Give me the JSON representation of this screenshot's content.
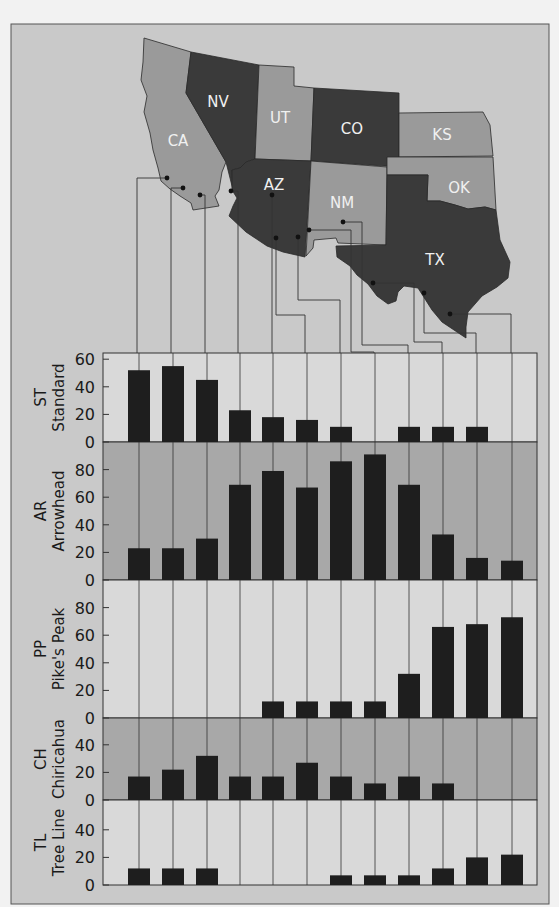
{
  "figure": {
    "frame": {
      "x": 11,
      "y": 24,
      "w": 538,
      "h": 880
    },
    "colors": {
      "page_bg": "#f2f2f2",
      "frame_bg": "#c9c9c9",
      "panel_light": "#d9d9d9",
      "panel_dark": "#a8a8a8",
      "bar": "#1e1e1e",
      "state_light": "#9a9a9a",
      "state_dark": "#3a3a3a",
      "state_label": "#f0f0f0",
      "line": "#333333",
      "text": "#1a1a1a"
    }
  },
  "map": {
    "states": [
      {
        "id": "CA",
        "label": "CA",
        "tone": "light",
        "label_x": 178,
        "label_y": 146
      },
      {
        "id": "NV",
        "label": "NV",
        "tone": "dark",
        "label_x": 218,
        "label_y": 107
      },
      {
        "id": "UT",
        "label": "UT",
        "tone": "light",
        "label_x": 280,
        "label_y": 123
      },
      {
        "id": "CO",
        "label": "CO",
        "tone": "dark",
        "label_x": 352,
        "label_y": 134
      },
      {
        "id": "KS",
        "label": "KS",
        "tone": "light",
        "label_x": 442,
        "label_y": 140
      },
      {
        "id": "AZ",
        "label": "AZ",
        "tone": "dark",
        "label_x": 274,
        "label_y": 190
      },
      {
        "id": "NM",
        "label": "NM",
        "tone": "light",
        "label_x": 342,
        "label_y": 208
      },
      {
        "id": "OK",
        "label": "OK",
        "tone": "light",
        "label_x": 459,
        "label_y": 193
      },
      {
        "id": "TX",
        "label": "TX",
        "tone": "dark",
        "label_x": 435,
        "label_y": 265
      }
    ],
    "sites": [
      {
        "dot": [
          167,
          178
        ],
        "path": [
          [
            167,
            178
          ],
          [
            137,
            178
          ],
          [
            137,
            353
          ]
        ]
      },
      {
        "dot": [
          183,
          188
        ],
        "path": [
          [
            183,
            188
          ],
          [
            171,
            188
          ],
          [
            171,
            353
          ]
        ]
      },
      {
        "dot": [
          200,
          195
        ],
        "path": [
          [
            200,
            195
          ],
          [
            205,
            195
          ],
          [
            205,
            353
          ]
        ]
      },
      {
        "dot": [
          231,
          191
        ],
        "path": [
          [
            231,
            191
          ],
          [
            238,
            191
          ],
          [
            238,
            353
          ]
        ]
      },
      {
        "dot": [
          272,
          195
        ],
        "path": [
          [
            272,
            195
          ],
          [
            272,
            353
          ]
        ]
      },
      {
        "dot": [
          276,
          238
        ],
        "path": [
          [
            276,
            238
          ],
          [
            276,
            315
          ],
          [
            305,
            315
          ],
          [
            305,
            353
          ]
        ]
      },
      {
        "dot": [
          298,
          237
        ],
        "path": [
          [
            298,
            237
          ],
          [
            298,
            300
          ],
          [
            340,
            300
          ],
          [
            340,
            353
          ]
        ]
      },
      {
        "dot": [
          309,
          230
        ],
        "path": [
          [
            309,
            230
          ],
          [
            351,
            230
          ],
          [
            351,
            352
          ],
          [
            374,
            352
          ],
          [
            374,
            353
          ]
        ]
      },
      {
        "dot": [
          343,
          222
        ],
        "path": [
          [
            343,
            222
          ],
          [
            362,
            222
          ],
          [
            362,
            345
          ],
          [
            408,
            345
          ],
          [
            408,
            353
          ]
        ]
      },
      {
        "dot": [
          373,
          283
        ],
        "path": [
          [
            373,
            283
          ],
          [
            414,
            283
          ],
          [
            414,
            342
          ],
          [
            442,
            342
          ],
          [
            442,
            353
          ]
        ]
      },
      {
        "dot": [
          424,
          293
        ],
        "path": [
          [
            424,
            293
          ],
          [
            424,
            333
          ],
          [
            476,
            333
          ],
          [
            476,
            353
          ]
        ]
      },
      {
        "dot": [
          450,
          314
        ],
        "path": [
          [
            450,
            314
          ],
          [
            511,
            314
          ],
          [
            511,
            353
          ]
        ]
      }
    ]
  },
  "chart_data": {
    "type": "bar",
    "title": "",
    "xlabel": "",
    "categories": [
      "Site 1",
      "Site 2",
      "Site 3",
      "Site 4",
      "Site 5",
      "Site 6",
      "Site 7",
      "Site 8",
      "Site 9",
      "Site 10",
      "Site 11",
      "Site 12"
    ],
    "grid": "vertical leader lines per site",
    "series": [
      {
        "name": "Standard",
        "code": "ST",
        "values": [
          52,
          55,
          45,
          23,
          18,
          16,
          11,
          0,
          11,
          11,
          11,
          0
        ],
        "ylim": [
          0,
          65
        ],
        "ticks": [
          0,
          20,
          40,
          60
        ]
      },
      {
        "name": "Arrowhead",
        "code": "AR",
        "values": [
          23,
          23,
          30,
          69,
          79,
          67,
          86,
          91,
          69,
          33,
          16,
          14
        ],
        "ylim": [
          0,
          100
        ],
        "ticks": [
          0,
          20,
          40,
          60,
          80
        ]
      },
      {
        "name": "Pike's Peak",
        "code": "PP",
        "values": [
          0,
          0,
          0,
          0,
          12,
          12,
          12,
          12,
          32,
          66,
          68,
          73
        ],
        "ylim": [
          0,
          100
        ],
        "ticks": [
          0,
          20,
          40,
          60,
          80
        ]
      },
      {
        "name": "Chiricahua",
        "code": "CH",
        "values": [
          17,
          22,
          32,
          17,
          17,
          27,
          17,
          12,
          17,
          12,
          0,
          0
        ],
        "ylim": [
          0,
          60
        ],
        "ticks": [
          0,
          20,
          40
        ]
      },
      {
        "name": "Tree Line",
        "code": "TL",
        "values": [
          12,
          12,
          12,
          0,
          0,
          0,
          7,
          7,
          7,
          12,
          20,
          22
        ],
        "ylim": [
          0,
          60
        ],
        "ticks": [
          0,
          20,
          40
        ]
      }
    ]
  },
  "layout": {
    "plot_left": 103,
    "plot_right": 537,
    "col_x": [
      139,
      173,
      207,
      240,
      273,
      307,
      341,
      375,
      409,
      443,
      477,
      512
    ],
    "bar_width": 22,
    "px_per_unit": 1.38,
    "panels": [
      {
        "top": 353,
        "bottom": 442,
        "tone": "light"
      },
      {
        "top": 442,
        "bottom": 580,
        "tone": "dark"
      },
      {
        "top": 580,
        "bottom": 718,
        "tone": "light"
      },
      {
        "top": 718,
        "bottom": 800,
        "tone": "dark"
      },
      {
        "top": 800,
        "bottom": 885,
        "tone": "light"
      }
    ]
  }
}
